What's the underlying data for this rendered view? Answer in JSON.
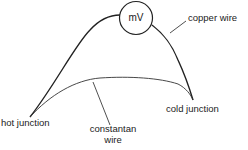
{
  "diagram": {
    "type": "thermocouple circuit",
    "meter_label": "mV",
    "labels": {
      "copper_wire": "copper wire",
      "cold_junction": "cold junction",
      "hot_junction": "hot junction",
      "constantan_line1": "constantan",
      "constantan_line2": "wire"
    },
    "colors": {
      "stroke": "#222222",
      "background": "#ffffff"
    }
  }
}
